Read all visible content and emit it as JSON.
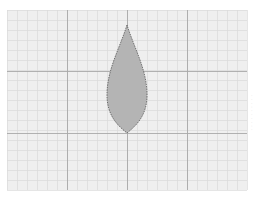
{
  "diagram": {
    "type": "shape-on-grid",
    "canvas": {
      "width": 257,
      "height": 199
    },
    "grid": {
      "left": 7,
      "top": 10,
      "right": 247,
      "bottom": 190,
      "minor_spacing": 10,
      "major_x": [
        67,
        127,
        187
      ],
      "major_y": [
        71,
        133
      ],
      "background": "#efefef",
      "minor_color": "#dadada",
      "major_color": "#a8a8a8"
    },
    "shape": {
      "name": "leaf",
      "tip": [
        127,
        25
      ],
      "base": [
        127,
        133
      ],
      "widest_y": 95,
      "left_x": 107,
      "right_x": 147,
      "fill": "#b4b4b4",
      "stroke": "#555555",
      "stroke_style": "dashed"
    },
    "side_text": "· · · · · · · · · ·"
  }
}
